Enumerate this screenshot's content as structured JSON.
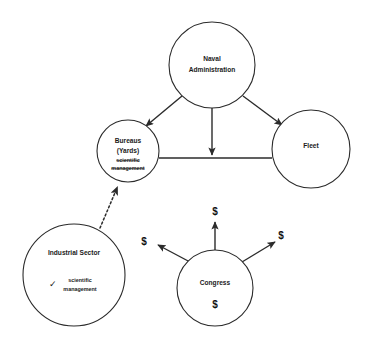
{
  "diagram": {
    "type": "node-link-diagram",
    "background_color": "#ffffff",
    "stroke_color": "#2b2b2b",
    "nodes": [
      {
        "id": "naval-administration",
        "label_line1": "Naval",
        "label_line2": "Administration",
        "cx": 212,
        "cy": 65,
        "r": 43
      },
      {
        "id": "bureaus",
        "label_line1": "Bureaus",
        "label_line2": "(Yards)",
        "sublabel_line1": "scientific",
        "sublabel_line2": "management",
        "sublabel_state": "struck-through",
        "cx": 128,
        "cy": 151,
        "r": 31
      },
      {
        "id": "fleet",
        "label_line1": "Fleet",
        "cx": 311,
        "cy": 149,
        "r": 39
      },
      {
        "id": "industrial-sector",
        "label_line1": "Industrial Sector",
        "sublabel_line1": "scientific",
        "sublabel_line2": "management",
        "sublabel_state": "checked",
        "check_glyph": "✓",
        "cx": 74,
        "cy": 275,
        "r": 51
      },
      {
        "id": "congress",
        "label_line1": "Congress",
        "money_glyph": "$",
        "cx": 215,
        "cy": 288,
        "r": 38
      }
    ],
    "edges": [
      {
        "id": "naval-to-bureaus",
        "from": "naval-administration",
        "to": "bureaus",
        "style": "solid",
        "arrow": true
      },
      {
        "id": "naval-to-center",
        "from": "naval-administration",
        "to": "bureaus-fleet-link",
        "style": "solid",
        "arrow": true
      },
      {
        "id": "naval-to-fleet",
        "from": "naval-administration",
        "to": "fleet",
        "style": "solid",
        "arrow": true
      },
      {
        "id": "bureaus-to-fleet",
        "from": "bureaus",
        "to": "fleet",
        "style": "solid",
        "arrow": false
      },
      {
        "id": "industrial-to-bureaus",
        "from": "industrial-sector",
        "to": "bureaus",
        "style": "dotted",
        "arrow": true
      },
      {
        "id": "congress-to-left",
        "from": "congress",
        "to": "industrial-sector",
        "style": "solid",
        "arrow": true,
        "label": "$"
      },
      {
        "id": "congress-to-up",
        "from": "congress",
        "to": "bureaus-fleet-link",
        "style": "solid",
        "arrow": true,
        "label": "$"
      },
      {
        "id": "congress-to-right",
        "from": "congress",
        "to": "fleet",
        "style": "solid",
        "arrow": true,
        "label": "$"
      }
    ],
    "money_labels": [
      {
        "id": "money-left",
        "text": "$",
        "x": 144,
        "y": 242
      },
      {
        "id": "money-top",
        "text": "$",
        "x": 215,
        "y": 212
      },
      {
        "id": "money-right",
        "text": "$",
        "x": 281,
        "y": 236
      }
    ]
  }
}
